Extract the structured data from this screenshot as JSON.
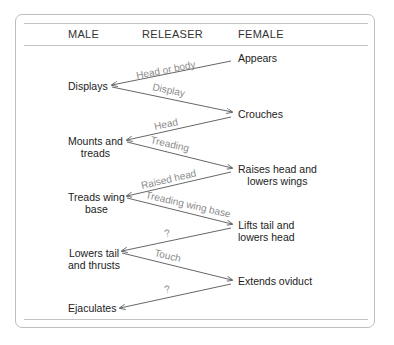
{
  "headers": {
    "male": "MALE",
    "releaser": "RELEASER",
    "female": "FEMALE"
  },
  "male": [
    {
      "lines": [
        "Displays"
      ]
    },
    {
      "lines": [
        "Mounts and",
        "treads"
      ]
    },
    {
      "lines": [
        "Treads wing",
        "base"
      ]
    },
    {
      "lines": [
        "Lowers tail",
        "and thrusts"
      ]
    },
    {
      "lines": [
        "Ejaculates"
      ]
    }
  ],
  "female": [
    {
      "lines": [
        "Appears"
      ]
    },
    {
      "lines": [
        "Crouches"
      ]
    },
    {
      "lines": [
        "Raises head and",
        "lowers wings"
      ]
    },
    {
      "lines": [
        "Lifts tail and",
        "lowers head"
      ]
    },
    {
      "lines": [
        "Extends oviduct"
      ]
    }
  ],
  "releasers": [
    {
      "label": "Head or body",
      "direction": "female-to-male"
    },
    {
      "label": "Display",
      "direction": "male-to-female"
    },
    {
      "label": "Head",
      "direction": "female-to-male"
    },
    {
      "label": "Treading",
      "direction": "male-to-female"
    },
    {
      "label": "Raised head",
      "direction": "female-to-male"
    },
    {
      "label": "Treading wing base",
      "direction": "male-to-female"
    },
    {
      "label": "?",
      "direction": "female-to-male"
    },
    {
      "label": "Touch",
      "direction": "male-to-female"
    },
    {
      "label": "?",
      "direction": "female-to-male"
    }
  ],
  "colors": {
    "text": "#222222",
    "releaser_text": "#8a8a8a",
    "lines": "#555555",
    "frame": "#bdbdbd"
  }
}
